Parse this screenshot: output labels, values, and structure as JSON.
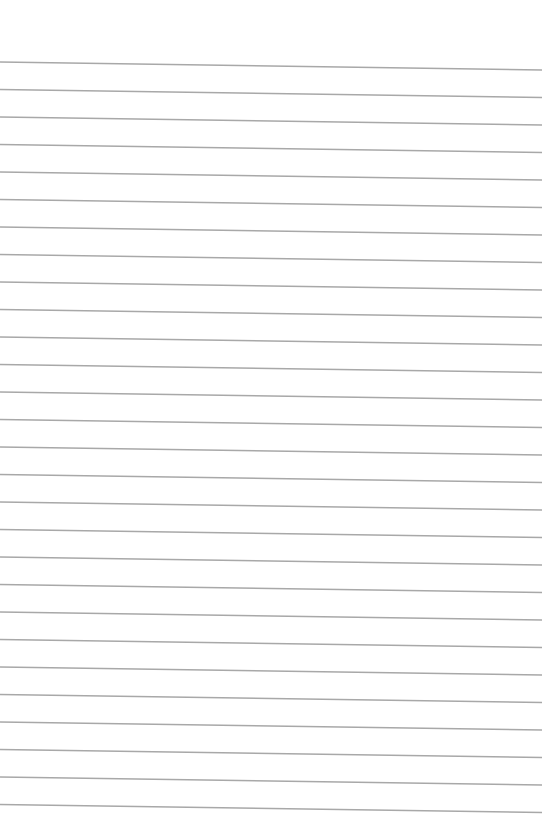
{
  "sheet": {
    "type": "blank lined paper",
    "background_color": "#ffffff",
    "rule_color": "#a8a8a8",
    "rule_count": 28,
    "first_rule_y_left": 62,
    "first_rule_y_right": 70,
    "rule_spacing": 27.5,
    "text": ""
  }
}
